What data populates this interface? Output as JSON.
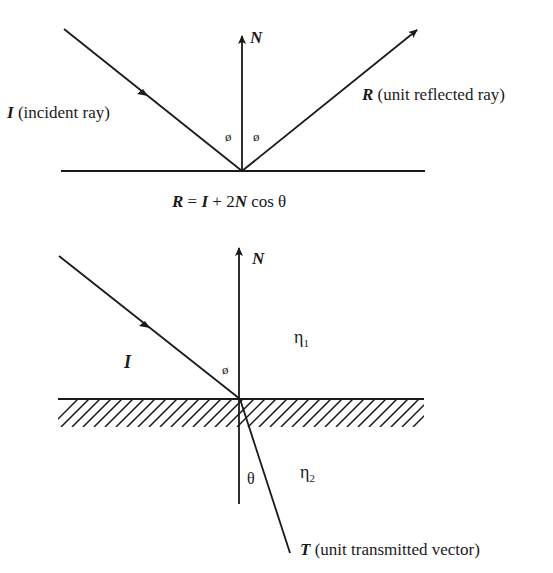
{
  "reflection": {
    "normal_label": "N",
    "incident_symbol": "I",
    "incident_text": " (incident ray)",
    "reflected_symbol": "R",
    "reflected_text": " (unit reflected ray)",
    "angle_left": "ø",
    "angle_right": "ø",
    "equation": {
      "r": "R",
      "eq": " = ",
      "i": "I",
      "plus": " + 2",
      "n": "N",
      "cos": " cos θ"
    }
  },
  "refraction": {
    "normal_label": "N",
    "incident_symbol": "I",
    "angle_incident": "ø",
    "angle_transmitted": "θ",
    "medium1": "η",
    "medium1_sub": "1",
    "medium2": "η",
    "medium2_sub": "2",
    "transmitted_symbol": "T",
    "transmitted_text": " (unit transmitted vector)"
  },
  "colors": {
    "ink": "#1a1a1a",
    "background": "#ffffff"
  }
}
